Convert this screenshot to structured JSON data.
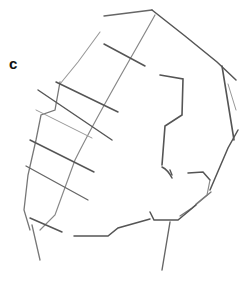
{
  "figure": {
    "panel_label": "c",
    "stroke_color": "#555555"
  }
}
